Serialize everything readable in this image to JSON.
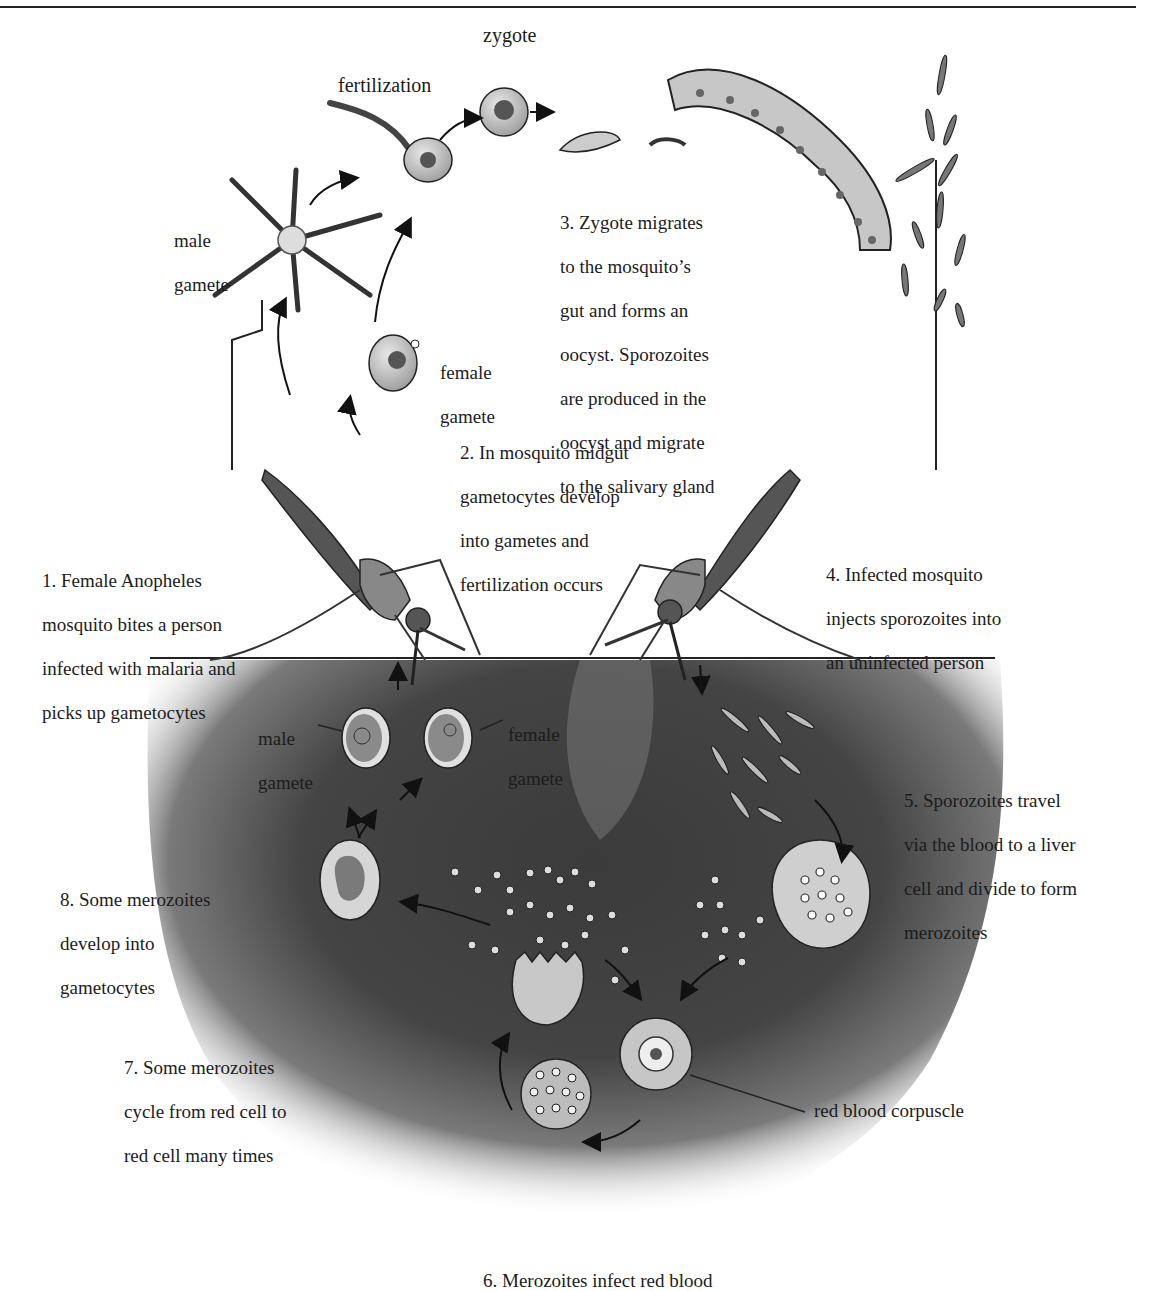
{
  "labels": {
    "zygote": "zygote",
    "fertilization": "fertilization",
    "male_gamete_top": [
      "male",
      "gamete"
    ],
    "female_gamete_top": [
      "female",
      "gamete"
    ],
    "male_gamete_blood": [
      "male",
      "gamete"
    ],
    "female_gamete_blood": [
      "female",
      "gamete"
    ],
    "red_blood_corpuscle": "red blood corpuscle"
  },
  "steps": [
    {
      "id": 1,
      "lines": [
        "1. Female Anopheles",
        "mosquito bites a person",
        "infected with malaria and",
        "picks up gametocytes"
      ]
    },
    {
      "id": 2,
      "lines": [
        "2. In mosquito midgut",
        "gametocytes develop",
        "into gametes and",
        "fertilization occurs"
      ]
    },
    {
      "id": 3,
      "lines": [
        "3. Zygote migrates",
        "to the mosquito’s",
        "gut and forms an",
        "oocyst. Sporozoites",
        "are produced in the",
        "oocyst and migrate",
        "to the salivary gland"
      ]
    },
    {
      "id": 4,
      "lines": [
        "4. Infected mosquito",
        "injects sporozoites into",
        "an uninfected person"
      ]
    },
    {
      "id": 5,
      "lines": [
        "5. Sporozoites travel",
        "via the blood to a liver",
        "cell and divide to form",
        "merozoites"
      ]
    },
    {
      "id": 6,
      "lines": [
        "6. Merozoites infect red blood"
      ]
    },
    {
      "id": 7,
      "lines": [
        "7. Some merozoites",
        "cycle from red cell to",
        "red cell many times"
      ]
    },
    {
      "id": 8,
      "lines": [
        "8. Some merozoites",
        "develop into",
        "gametocytes"
      ]
    }
  ],
  "colors": {
    "blood_dark": "#3a3a3a",
    "blood_mid": "#6a6a6a",
    "cell_fill": "#bdbdbd",
    "ink": "#1a1a1a"
  }
}
